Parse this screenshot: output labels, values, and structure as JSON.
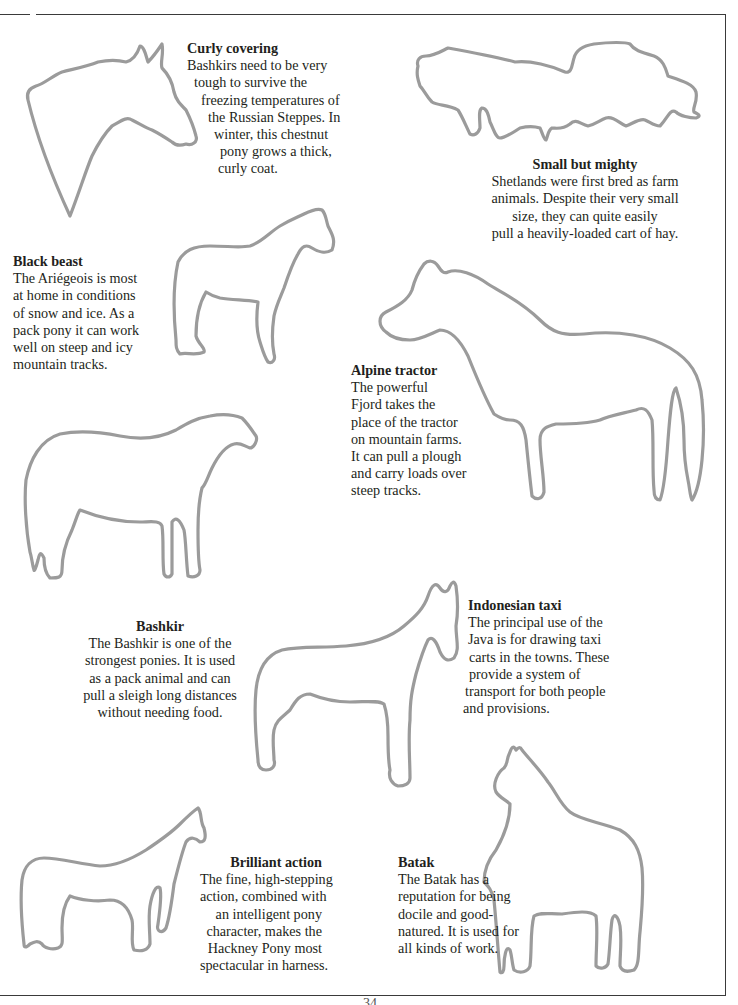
{
  "page": {
    "page_number": "34",
    "outline_color": "#9b9b9b",
    "text_color": "#231f20"
  },
  "captions": {
    "curly": {
      "title": "Curly covering",
      "lines": [
        "Bashkirs need to be very",
        "tough to survive the",
        "freezing temperatures of",
        "the Russian Steppes. In",
        "winter, this chestnut",
        "pony grows a thick,",
        "curly coat."
      ]
    },
    "small": {
      "title": "Small but mighty",
      "lines": [
        "Shetlands were first bred as farm",
        "animals. Despite their very small",
        "size, they can quite easily",
        "pull a heavily-loaded cart of hay."
      ]
    },
    "black": {
      "title": "Black beast",
      "lines": [
        "The Ariégeois is most",
        "at home in conditions",
        "of snow and ice. As a",
        "pack pony it can work",
        "well on steep and icy",
        "mountain tracks."
      ]
    },
    "alpine": {
      "title": "Alpine tractor",
      "lines": [
        "The powerful",
        "Fjord takes the",
        "place of the tractor",
        "on mountain farms.",
        "It can pull a plough",
        "and carry loads over",
        "steep tracks."
      ]
    },
    "bashkir": {
      "title": "Bashkir",
      "lines": [
        "The Bashkir is one of the",
        "strongest ponies. It is used",
        "as a pack animal and can",
        "pull a sleigh long distances",
        "without needing food."
      ]
    },
    "indo": {
      "title": "Indonesian taxi",
      "lines": [
        "The principal use of the",
        "Java is for drawing taxi",
        "carts in the towns. These",
        "provide a system of",
        "transport for both people",
        "and provisions."
      ]
    },
    "brill": {
      "title": "Brilliant action",
      "lines": [
        "The fine, high-stepping",
        "action, combined with",
        "an intelligent pony",
        "character, makes the",
        "Hackney Pony most",
        "spectacular in harness."
      ]
    },
    "batak": {
      "title": "Batak",
      "lines": [
        "The Batak has a",
        "reputation for being",
        "docile and good-",
        "natured. It is used for",
        "all kinds of work."
      ]
    }
  },
  "outlines": [
    {
      "name": "bashkir-head-outline"
    },
    {
      "name": "shetland-outline"
    },
    {
      "name": "ariegeois-outline"
    },
    {
      "name": "fjord-outline"
    },
    {
      "name": "bashkir-outline"
    },
    {
      "name": "java-outline"
    },
    {
      "name": "hackney-outline"
    },
    {
      "name": "batak-outline"
    }
  ]
}
